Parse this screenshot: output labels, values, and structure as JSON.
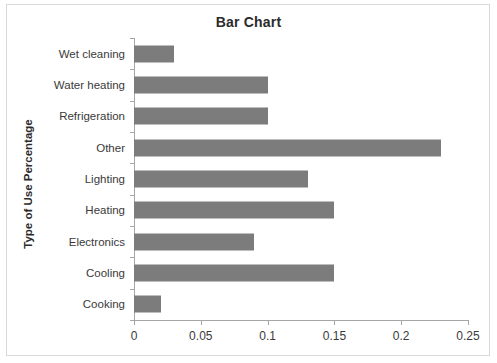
{
  "chart_data": {
    "type": "bar",
    "orientation": "horizontal",
    "title": "Bar Chart",
    "xlabel": "",
    "ylabel": "Type of Use Percentage",
    "categories": [
      "Cooking",
      "Cooling",
      "Electronics",
      "Heating",
      "Lighting",
      "Other",
      "Refrigeration",
      "Water heating",
      "Wet cleaning"
    ],
    "values": [
      0.02,
      0.15,
      0.09,
      0.15,
      0.13,
      0.23,
      0.1,
      0.1,
      0.03
    ],
    "xlim": [
      0,
      0.25
    ],
    "xticks": [
      0,
      0.05,
      0.1,
      0.15,
      0.2,
      0.25
    ],
    "xtick_labels": [
      "0",
      "0.05",
      "0.1",
      "0.15",
      "0.2",
      "0.25"
    ],
    "grid": false,
    "legend": false,
    "bar_color": "#7c7c7c",
    "axis_color": "#a6a6a6",
    "background": "#ffffff"
  }
}
